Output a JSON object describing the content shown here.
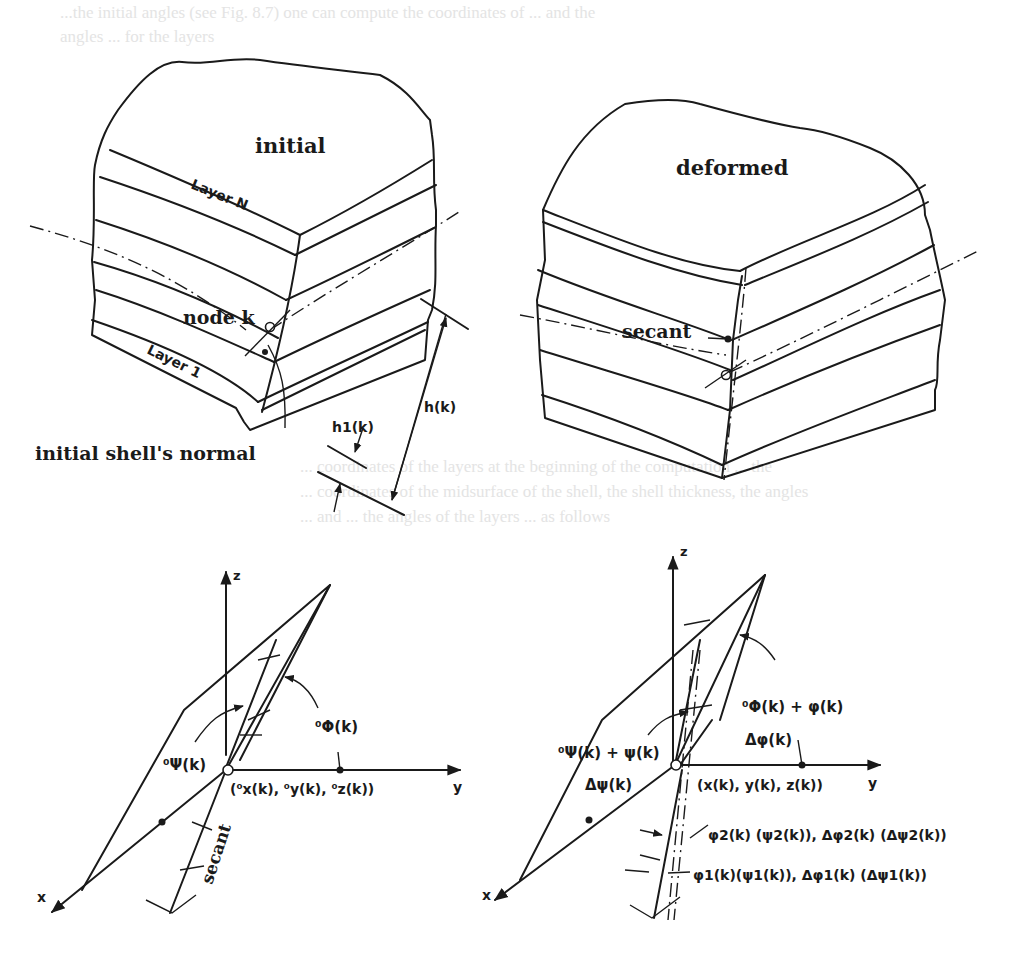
{
  "background_text": {
    "line_1": "...the initial angles (see Fig. 8.7) one can compute the coordinates of ... and the",
    "line_2": "angles ... for the layers",
    "line_3": "... coordinates of the layers at the beginning of the computation ... the",
    "line_4": "... coordinates of the midsurface of the shell, the shell thickness, the angles",
    "line_5": "... and ... the angles of the layers ... as follows"
  },
  "top_left_panel": {
    "title": "initial",
    "layer_top": "Layer N",
    "layer_bottom": "Layer 1",
    "node_label": "node k",
    "normal_label": "initial shell's normal",
    "thickness_layer": "h1(k)",
    "thickness_total": "h(k)"
  },
  "top_right_panel": {
    "title": "deformed",
    "secant_label": "secant"
  },
  "bottom_left_panel": {
    "axis_z": "z",
    "axis_y": "y",
    "axis_x": "x",
    "angle_phi": "⁰Φ(k)",
    "angle_psi": "⁰Ψ(k)",
    "origin": "(⁰x(k), ⁰y(k), ⁰z(k))",
    "secant_label": "secant"
  },
  "bottom_right_panel": {
    "axis_z": "z",
    "axis_y": "y",
    "axis_x": "x",
    "angle_phi": "⁰Φ(k) + φ(k)",
    "delta_phi": "Δφ(k)",
    "angle_psi": "⁰Ψ(k) + ψ(k)",
    "delta_psi": "Δψ(k)",
    "origin": "(x(k), y(k), z(k))",
    "layer_2_angles": "φ2(k) (ψ2(k)), Δφ2(k) (Δψ2(k))",
    "layer_1_angles": "φ1(k)(ψ1(k)), Δφ1(k) (Δψ1(k))"
  }
}
